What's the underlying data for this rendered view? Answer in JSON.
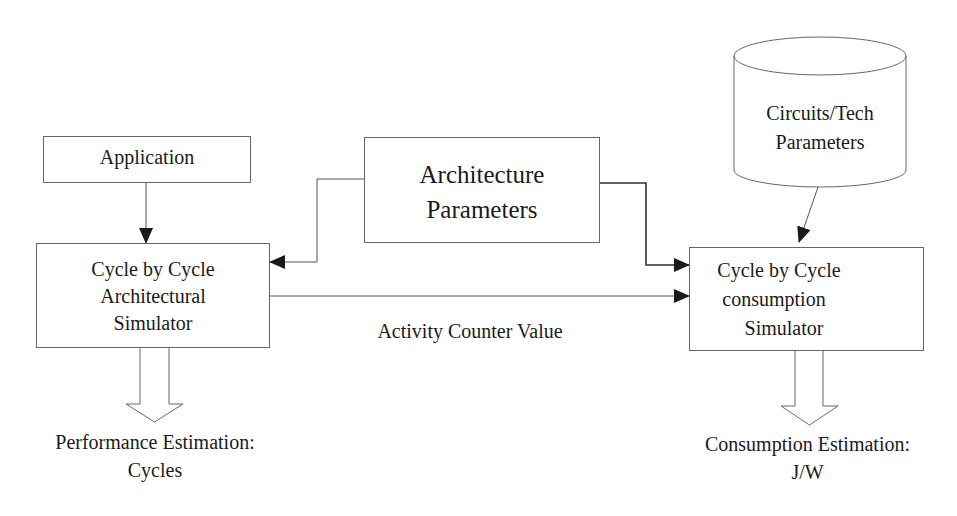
{
  "diagram": {
    "nodes": {
      "application": {
        "label": "Application"
      },
      "arch_simulator": {
        "line1": "Cycle by Cycle",
        "line2": "Architectural",
        "line3": "Simulator"
      },
      "arch_params": {
        "line1": "Architecture",
        "line2": "Parameters"
      },
      "circuits_db": {
        "line1": "Circuits/Tech",
        "line2": "Parameters"
      },
      "consumption_simulator": {
        "line1": "Cycle by Cycle",
        "line2": "consumption",
        "line3": "Simulator"
      }
    },
    "edges": {
      "activity_counter": {
        "label": "Activity Counter Value"
      }
    },
    "outputs": {
      "performance": {
        "line1": "Performance Estimation:",
        "line2": "Cycles"
      },
      "consumption": {
        "line1": "Consumption Estimation:",
        "line2": "J/W"
      }
    },
    "colors": {
      "stroke": "#555555",
      "arrow": "#1a1a1a",
      "text": "#1a1a1a"
    }
  }
}
